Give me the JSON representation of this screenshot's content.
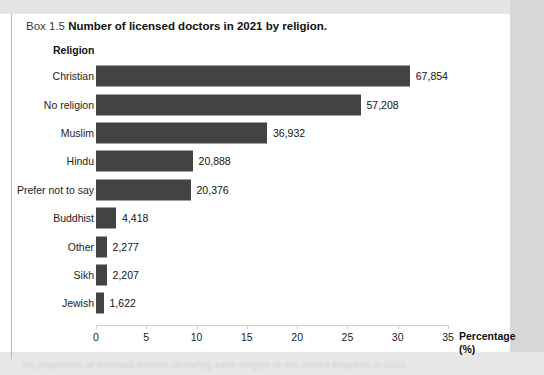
{
  "caption": {
    "box_number": "Box 1.5",
    "title": "Number of licensed doctors in 2021 by religion."
  },
  "chart_data": {
    "type": "bar",
    "orientation": "horizontal",
    "title": "Number of licensed doctors in 2021 by religion.",
    "xlabel": "Percentage (%)",
    "ylabel": "Religion",
    "xlim": [
      0,
      35
    ],
    "xticks": [
      0,
      5,
      10,
      15,
      20,
      25,
      30,
      35
    ],
    "grid": false,
    "legend": null,
    "bar_color": "#434343",
    "categories": [
      "Christian",
      "No religion",
      "Muslim",
      "Hindu",
      "Prefer not to say",
      "Buddhist",
      "Other",
      "Sikh",
      "Jewish"
    ],
    "values": [
      31.2,
      26.3,
      17.0,
      9.6,
      9.4,
      2.0,
      1.05,
      1.05,
      0.75
    ],
    "data_labels": [
      "67,854",
      "57,208",
      "36,932",
      "20,888",
      "20,376",
      "4,418",
      "2,277",
      "2,207",
      "1,622"
    ],
    "counts": [
      67854,
      57208,
      36932,
      20888,
      20376,
      4418,
      2277,
      2207,
      1622
    ]
  },
  "axis": {
    "y_title": "Religion",
    "x_title_line1": "Percentage",
    "x_title_line2": "(%)",
    "tick_labels": [
      "0",
      "5",
      "10",
      "15",
      "20",
      "25",
      "30",
      "35"
    ]
  },
  "page_bleed": {
    "ghost_text": "the proportion of licensed doctors declaring each religion in the United Kingdom in 2021"
  }
}
